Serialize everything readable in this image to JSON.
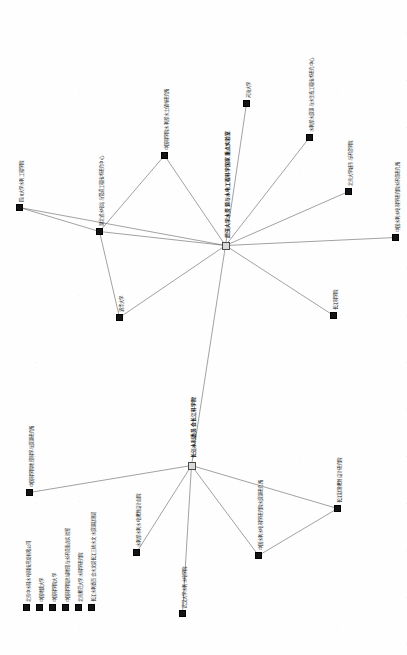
{
  "figure": {
    "type": "network-graph",
    "orientation": "rotated-90",
    "width": 407,
    "height": 655,
    "background_color": "#ffffff",
    "node_color": "#141414",
    "hub_color": "#d9d9d9",
    "edge_color": "#555555"
  },
  "chart_data": {
    "type": "scatter",
    "title": "",
    "xlabel": "",
    "ylabel": "",
    "grid": false,
    "legend": "none",
    "nodes": [
      {
        "id": "n1",
        "label": "四川大学水利工程学院",
        "x": 16,
        "y": 204,
        "kind": "leaf",
        "label_x": 19,
        "label_y": 202
      },
      {
        "id": "n2",
        "label": "湖北省水电站与管道工程技术研究中心",
        "x": 96,
        "y": 228,
        "kind": "leaf",
        "label_x": 99,
        "label_y": 226
      },
      {
        "id": "n3",
        "label": "中国科学院水利部水土保持研究所",
        "x": 161,
        "y": 152,
        "kind": "leaf",
        "label_x": 164,
        "label_y": 150
      },
      {
        "id": "n4",
        "label": "武汉大学水资源与水电工程科学国家重点实验室",
        "x": 222,
        "y": 242,
        "kind": "hub",
        "label_x": 225,
        "label_y": 238
      },
      {
        "id": "n5",
        "label": "河海大学",
        "x": 243,
        "y": 100,
        "kind": "leaf",
        "label_x": 246,
        "label_y": 98
      },
      {
        "id": "n6",
        "label": "水利部水资源与水生态工程技术研究中心",
        "x": 306,
        "y": 134,
        "kind": "leaf",
        "label_x": 309,
        "label_y": 132
      },
      {
        "id": "n7",
        "label": "北京大学城市与环境学院",
        "x": 345,
        "y": 188,
        "kind": "leaf",
        "label_x": 348,
        "label_y": 186
      },
      {
        "id": "n8",
        "label": "中国水利水电科学研究院水环境研究所",
        "x": 392,
        "y": 234,
        "kind": "leaf",
        "label_x": 395,
        "label_y": 232
      },
      {
        "id": "n9",
        "label": "长江科学院",
        "x": 330,
        "y": 312,
        "kind": "leaf",
        "label_x": 333,
        "label_y": 310
      },
      {
        "id": "n10",
        "label": "清华大学",
        "x": 116,
        "y": 314,
        "kind": "leaf",
        "label_x": 119,
        "label_y": 312
      },
      {
        "id": "m1",
        "label": "长江水利委员会长江科学院",
        "x": 188,
        "y": 462,
        "kind": "hub",
        "label_x": 191,
        "label_y": 458
      },
      {
        "id": "m2",
        "label": "中国科学院地理科学与资源研究所",
        "x": 26,
        "y": 489,
        "kind": "leaf",
        "label_x": 29,
        "label_y": 487
      },
      {
        "id": "m3",
        "label": "水利部水利水电规划设计总院",
        "x": 133,
        "y": 549,
        "kind": "leaf",
        "label_x": 136,
        "label_y": 547
      },
      {
        "id": "m4",
        "label": "中国水利水电科学研究院水资源研究所",
        "x": 255,
        "y": 552,
        "kind": "leaf",
        "label_x": 258,
        "label_y": 550
      },
      {
        "id": "m5",
        "label": "长江勘测规划设计研究院",
        "x": 334,
        "y": 505,
        "kind": "leaf",
        "label_x": 337,
        "label_y": 503
      },
      {
        "id": "m6",
        "label": "武汉大学水利水电学院",
        "x": 179,
        "y": 610,
        "kind": "leaf",
        "label_x": 182,
        "label_y": 608
      },
      {
        "id": "s1",
        "label": "北京中水科水电科技开发有限公司",
        "x": 23,
        "y": 604,
        "kind": "stack",
        "label_x": 26,
        "label_y": 602
      },
      {
        "id": "s2",
        "label": "中国地质大学",
        "x": 36,
        "y": 604,
        "kind": "stack",
        "label_x": 39,
        "label_y": 602
      },
      {
        "id": "s3",
        "label": "中国科学院大学",
        "x": 49,
        "y": 604,
        "kind": "stack",
        "label_x": 52,
        "label_y": 602
      },
      {
        "id": "s4",
        "label": "中国科学院流域地理与水环境重点实验室",
        "x": 62,
        "y": 604,
        "kind": "stack",
        "label_x": 65,
        "label_y": 602
      },
      {
        "id": "s5",
        "label": "北京师范大学水科学研究院",
        "x": 75,
        "y": 604,
        "kind": "stack",
        "label_x": 78,
        "label_y": 602
      },
      {
        "id": "s6",
        "label": "长江水利委员会水文局长江三峡水文水资源勘测局",
        "x": 88,
        "y": 604,
        "kind": "stack",
        "label_x": 91,
        "label_y": 602
      }
    ],
    "edges": [
      {
        "source": "n4",
        "target": "n1"
      },
      {
        "source": "n4",
        "target": "n2"
      },
      {
        "source": "n4",
        "target": "n3"
      },
      {
        "source": "n4",
        "target": "n5"
      },
      {
        "source": "n4",
        "target": "n6"
      },
      {
        "source": "n4",
        "target": "n7"
      },
      {
        "source": "n4",
        "target": "n8"
      },
      {
        "source": "n4",
        "target": "n9"
      },
      {
        "source": "n4",
        "target": "n10"
      },
      {
        "source": "n1",
        "target": "n2"
      },
      {
        "source": "n2",
        "target": "n3"
      },
      {
        "source": "n2",
        "target": "n10"
      },
      {
        "source": "n4",
        "target": "m1"
      },
      {
        "source": "m1",
        "target": "m2"
      },
      {
        "source": "m1",
        "target": "m3"
      },
      {
        "source": "m1",
        "target": "m4"
      },
      {
        "source": "m1",
        "target": "m5"
      },
      {
        "source": "m1",
        "target": "m6"
      },
      {
        "source": "m4",
        "target": "m5"
      }
    ]
  }
}
